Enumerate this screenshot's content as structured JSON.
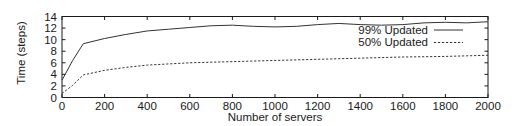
{
  "chart_data": {
    "type": "line",
    "title": "",
    "xlabel": "Number of servers",
    "ylabel": "Time (steps)",
    "xlim": [
      0,
      2000
    ],
    "ylim": [
      0,
      14
    ],
    "xticks": [
      0,
      200,
      400,
      600,
      800,
      1000,
      1200,
      1400,
      1600,
      1800,
      2000
    ],
    "yticks": [
      0,
      2,
      4,
      6,
      8,
      10,
      12,
      14
    ],
    "grid": false,
    "legend_position": "center-right",
    "x": [
      0,
      50,
      100,
      200,
      300,
      400,
      500,
      600,
      700,
      800,
      900,
      1000,
      1100,
      1200,
      1300,
      1400,
      1500,
      1600,
      1700,
      1800,
      1900,
      2000
    ],
    "series": [
      {
        "name": "99% Updated",
        "style": "solid",
        "values": [
          3.0,
          6.4,
          9.3,
          10.2,
          10.9,
          11.5,
          11.8,
          12.1,
          12.4,
          12.5,
          12.3,
          12.2,
          12.3,
          12.6,
          12.8,
          12.6,
          12.5,
          12.6,
          12.9,
          13.0,
          12.9,
          13.1
        ]
      },
      {
        "name": "50% Updated",
        "style": "dashed",
        "values": [
          0.7,
          2.1,
          3.9,
          4.7,
          5.2,
          5.6,
          5.8,
          6.0,
          6.1,
          6.2,
          6.3,
          6.4,
          6.5,
          6.6,
          6.7,
          6.8,
          6.9,
          7.0,
          7.05,
          7.1,
          7.2,
          7.3
        ]
      }
    ],
    "xtick_labels": [
      "0",
      "200",
      "400",
      "600",
      "800",
      "1000",
      "1200",
      "1400",
      "1600",
      "1800",
      "2000"
    ],
    "ytick_labels": [
      "0",
      "2",
      "4",
      "6",
      "8",
      "10",
      "12",
      "14"
    ],
    "legend": [
      "99% Updated",
      "50% Updated"
    ],
    "colors": {
      "line": "#333333",
      "axis": "#1a1a1a",
      "background": "#ffffff"
    }
  }
}
